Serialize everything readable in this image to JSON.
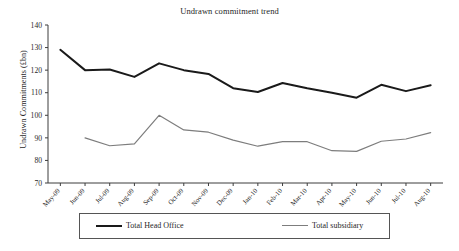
{
  "chart_data": {
    "type": "line",
    "title": "Undrawn commitment trend",
    "xlabel": "",
    "ylabel": "Undrawn Commitments (£bn)",
    "ylim": [
      70,
      140
    ],
    "yticks": [
      70,
      80,
      90,
      100,
      110,
      120,
      130,
      140
    ],
    "grid": false,
    "legend_position": "bottom",
    "categories": [
      "May-09",
      "Jun-09",
      "Jul-09",
      "Aug-09",
      "Sep-09",
      "Oct-09",
      "Nov-09",
      "Dec-09",
      "Jan-10",
      "Feb-10",
      "Mar-10",
      "Apr-10",
      "May-10",
      "Jun-10",
      "Jul-10",
      "Aug-10"
    ],
    "series": [
      {
        "name": "Total Head Office",
        "color": "#1a1a1a",
        "width": 2,
        "values": [
          129,
          120,
          120.3,
          117,
          123,
          120,
          118.3,
          112,
          110.3,
          114.3,
          112,
          110,
          107.8,
          113.5,
          110.7,
          113.3
        ]
      },
      {
        "name": "Total subsidiary",
        "color": "#7d7d7d",
        "width": 1.2,
        "values": [
          null,
          90,
          86.5,
          87.3,
          100,
          93.5,
          92.5,
          89,
          86.3,
          88.3,
          88.3,
          84.3,
          84,
          88.5,
          89.5,
          92.3
        ]
      }
    ]
  },
  "legend": {
    "items": [
      {
        "label": "Total Head Office"
      },
      {
        "label": "Total subsidiary"
      }
    ]
  }
}
